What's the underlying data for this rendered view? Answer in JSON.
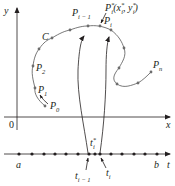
{
  "figure": {
    "type": "parametric-curve-partition",
    "axes": {
      "x_label": "x",
      "y_label": "y",
      "origin_label": "0",
      "t_label": "t"
    },
    "curve": {
      "name": "C",
      "start_point": "P",
      "start_sub": "0",
      "p1": "P",
      "p1_sub": "1",
      "p2": "P",
      "p2_sub": "2",
      "pim1": "P",
      "pim1_sub": "i − 1",
      "pi": "P",
      "pi_sub": "i",
      "pn": "P",
      "pn_sub": "n",
      "pistar": "P",
      "pistar_sup": "*",
      "pistar_sub": "i",
      "pistar_coords_open": "(x",
      "pistar_coords_x_sup": "*",
      "pistar_coords_x_sub": "i",
      "pistar_coords_sep": ", y",
      "pistar_coords_y_sup": "*",
      "pistar_coords_y_sub": "i",
      "pistar_coords_close": ")"
    },
    "number_line": {
      "a_label": "a",
      "b_label": "b",
      "t_im1": "t",
      "t_im1_sub": "i − 1",
      "t_i": "t",
      "t_i_sub": "i",
      "t_star": "t",
      "t_star_sup": "*",
      "t_star_sub": "i"
    },
    "colors": {
      "ink": "#231f20",
      "curve": "#555555",
      "points": "#6d6d6d"
    }
  }
}
